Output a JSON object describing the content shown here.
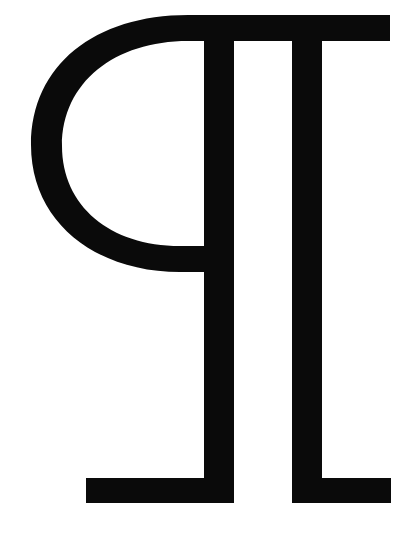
{
  "glyph": {
    "name": "pilcrow-like symbol",
    "description": "Black reversed-P glyph with two vertical stems and serif feet on white background",
    "fill_color": "#0a0a0a",
    "background_color": "#ffffff"
  }
}
